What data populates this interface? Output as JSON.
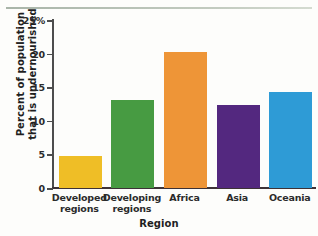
{
  "chart_data": {
    "type": "bar",
    "title": "",
    "xlabel": "Region",
    "ylabel_line1": "Percent of population",
    "ylabel_line2": "that is undernourished",
    "categories": [
      {
        "line1": "Developed",
        "line2": "regions"
      },
      {
        "line1": "Developing",
        "line2": "regions"
      },
      {
        "line1": "Africa",
        "line2": ""
      },
      {
        "line1": "Asia",
        "line2": ""
      },
      {
        "line1": "Oceania",
        "line2": ""
      }
    ],
    "values": [
      4.5,
      12.8,
      19.9,
      12.0,
      14.0
    ],
    "bar_colors": [
      "#efbe26",
      "#479b42",
      "#ee9537",
      "#53287f",
      "#2e9bd6"
    ],
    "ylim": [
      0,
      25
    ],
    "yticks": [
      0,
      5,
      10,
      15,
      20,
      25
    ],
    "ytick_labels": [
      "0",
      "5",
      "10",
      "15",
      "20",
      "25%"
    ],
    "grid": false,
    "legend": "none",
    "axis_color": "#3d3236"
  }
}
